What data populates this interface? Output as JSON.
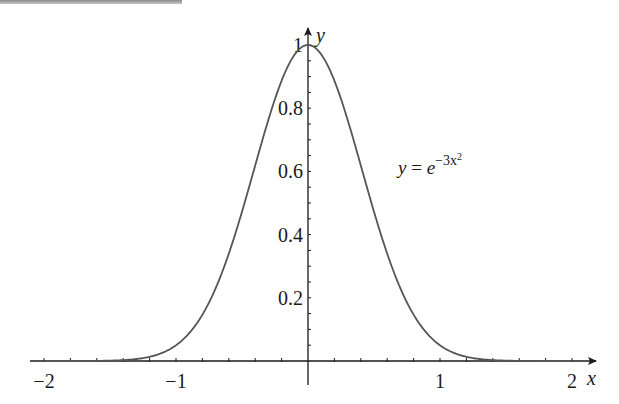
{
  "chart_data": {
    "type": "line",
    "title": "",
    "function": "y = e^(-3x^2)",
    "xlabel": "x",
    "ylabel": "y",
    "xlim": [
      -2.1,
      2.15
    ],
    "ylim": [
      0,
      1.05
    ],
    "x_ticks": [
      -2,
      -1,
      1,
      2
    ],
    "x_tick_labels": [
      "−2",
      "−1",
      "1",
      "2"
    ],
    "x_minor_step": 0.2,
    "y_ticks": [
      0.2,
      0.4,
      0.6,
      0.8,
      1
    ],
    "y_tick_labels": [
      "0.2",
      "0.4",
      "0.6",
      "0.8",
      "1"
    ],
    "y_minor_step": 0.05,
    "grid": false,
    "legend": null,
    "annotations": [
      {
        "text": "y = e^(−3x²)",
        "x": 1.05,
        "y": 0.6
      }
    ],
    "series": [
      {
        "name": "y = e^(-3x^2)",
        "color": "#555555",
        "x": [
          -2,
          -1.8,
          -1.6,
          -1.4,
          -1.2,
          -1.0,
          -0.8,
          -0.6,
          -0.4,
          -0.2,
          0,
          0.2,
          0.4,
          0.6,
          0.8,
          1.0,
          1.2,
          1.4,
          1.6,
          1.8,
          2
        ],
        "y": [
          0.0,
          0.0001,
          0.0005,
          0.0028,
          0.0133,
          0.0498,
          0.1466,
          0.3396,
          0.6188,
          0.8869,
          1.0,
          0.8869,
          0.6188,
          0.3396,
          0.1466,
          0.0498,
          0.0133,
          0.0028,
          0.0005,
          0.0001,
          0.0
        ]
      }
    ]
  },
  "labels": {
    "x_axis": "x",
    "y_axis": "y",
    "equation_y": "y",
    "equation_eq": " = ",
    "equation_base": "e",
    "equation_exp": "−3x",
    "equation_exp2": "2"
  }
}
